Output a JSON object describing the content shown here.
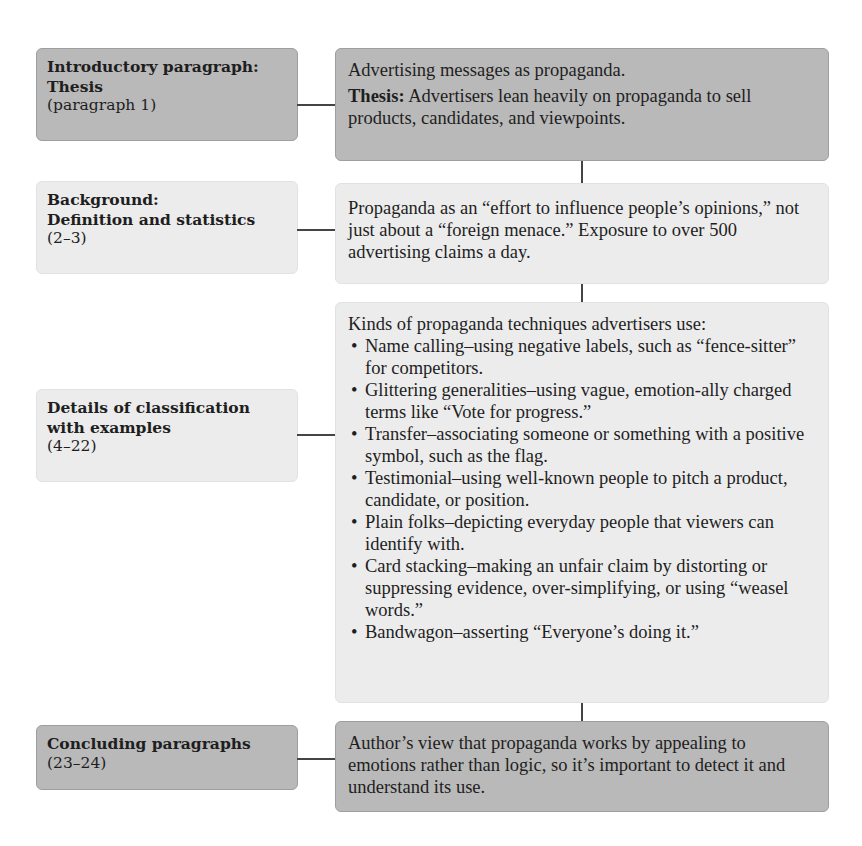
{
  "rows": [
    {
      "left": {
        "title_lines": [
          "Introductory paragraph:",
          "Thesis"
        ],
        "paragraphs": "(paragraph 1)",
        "style": "dark"
      },
      "right": {
        "line1": "Advertising messages as propaganda.",
        "thesis_label": "Thesis:",
        "thesis_text": " Advertisers lean heavily on propaganda to sell products, candidates, and viewpoints.",
        "style": "dark"
      }
    },
    {
      "left": {
        "title_lines": [
          "Background:",
          "Definition and statistics"
        ],
        "paragraphs": "(2–3)",
        "style": "light"
      },
      "right": {
        "text": "Propaganda as an “effort to influence people’s opinions,” not just about a “foreign menace.” Exposure to over 500 advertising claims a day.",
        "style": "light"
      }
    },
    {
      "left": {
        "title_lines": [
          "Details of classification",
          "with examples"
        ],
        "paragraphs": "(4–22)",
        "style": "light"
      },
      "right": {
        "intro": "Kinds of propaganda techniques advertisers use:",
        "bullets": [
          "Name calling–using negative labels, such as “fence-sitter” for competitors.",
          "Glittering generalities–using vague, emotion-ally charged terms like “Vote for progress.”",
          "Transfer–associating someone or something with a positive symbol, such as the flag.",
          "Testimonial–using well-known people to pitch a product, candidate, or position.",
          "Plain folks–depicting everyday people that viewers can identify with.",
          "Card stacking–making an unfair claim by distorting or suppressing evidence, over-simplifying, or using “weasel words.”",
          "Bandwagon–asserting “Everyone’s doing it.”"
        ],
        "style": "light"
      }
    },
    {
      "left": {
        "title_lines": [
          "Concluding paragraphs"
        ],
        "paragraphs": "(23–24)",
        "style": "dark"
      },
      "right": {
        "text": "Author’s view that propaganda works by appealing to emotions rather than logic, so it’s important to detect it and understand its use.",
        "style": "dark"
      }
    }
  ],
  "colors": {
    "dark_box": "#b9b9b9",
    "light_box": "#ececec",
    "connector": "#444444"
  }
}
